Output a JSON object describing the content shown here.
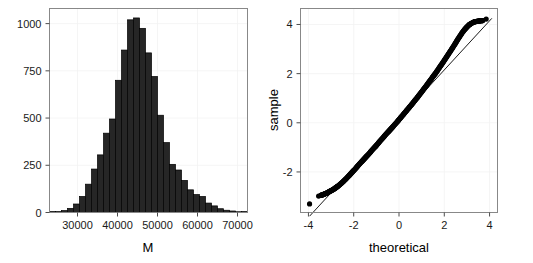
{
  "figure": {
    "width": 533,
    "height": 263,
    "background": "#ffffff",
    "panel_border_color": "#888888",
    "grid_color": "#f2f2f2",
    "bar_fill": "#262626",
    "bar_stroke": "#000000",
    "point_color": "#000000"
  },
  "chart_data": [
    {
      "type": "bar",
      "name": "histogram-of-M",
      "title": "",
      "xlabel": "M",
      "ylabel": "",
      "xlim": [
        23000,
        72500
      ],
      "ylim": [
        0,
        1080
      ],
      "xticks": [
        30000,
        40000,
        50000,
        60000,
        70000
      ],
      "xtick_labels": [
        "30000",
        "40000",
        "50000",
        "60000",
        "70000"
      ],
      "yticks": [
        0,
        250,
        500,
        750,
        1000
      ],
      "ytick_labels": [
        "0",
        "250",
        "500",
        "750",
        "1000"
      ],
      "grid": true,
      "legend": "none",
      "bin_width": 1500,
      "bin_starts": [
        23000,
        24500,
        26000,
        27500,
        29000,
        30500,
        32000,
        33500,
        35000,
        36500,
        38000,
        39500,
        41000,
        42500,
        44000,
        45500,
        47000,
        48500,
        50000,
        51500,
        53000,
        54500,
        56000,
        57500,
        59000,
        60500,
        62000,
        63500,
        65000,
        66500,
        68000,
        69500,
        71000
      ],
      "categories": [
        "23000",
        "24500",
        "26000",
        "27500",
        "29000",
        "30500",
        "32000",
        "33500",
        "35000",
        "36500",
        "38000",
        "39500",
        "41000",
        "42500",
        "44000",
        "45500",
        "47000",
        "48500",
        "50000",
        "51500",
        "53000",
        "54500",
        "56000",
        "57500",
        "59000",
        "60500",
        "62000",
        "63500",
        "65000",
        "66500",
        "68000",
        "69500",
        "71000"
      ],
      "values": [
        2,
        5,
        10,
        22,
        45,
        85,
        150,
        230,
        305,
        420,
        495,
        700,
        860,
        1020,
        1030,
        975,
        845,
        720,
        515,
        370,
        255,
        225,
        170,
        120,
        95,
        85,
        50,
        35,
        20,
        12,
        8,
        4,
        2
      ]
    },
    {
      "type": "scatter",
      "name": "normal-qq-plot",
      "title": "",
      "xlabel": "theoretical",
      "ylabel": "sample",
      "xlim": [
        -4.35,
        4.35
      ],
      "ylim": [
        -3.65,
        4.65
      ],
      "xticks": [
        -4,
        -2,
        0,
        2,
        4
      ],
      "xtick_labels": [
        "-4",
        "-2",
        "0",
        "2",
        "4"
      ],
      "yticks": [
        -2,
        0,
        2,
        4
      ],
      "ytick_labels": [
        "-2",
        "0",
        "2",
        "4"
      ],
      "grid": true,
      "legend": "none",
      "reference_line": {
        "slope": 1.0,
        "intercept": 0.15,
        "x_start": -3.95,
        "x_end": 4.1
      },
      "x": [
        -3.95,
        -3.55,
        -3.45,
        -3.38,
        -3.3,
        -3.22,
        -3.15,
        -3.08,
        -3.0,
        -2.92,
        -2.85,
        -2.78,
        -2.7,
        -2.6,
        -2.5,
        -2.4,
        -2.3,
        -2.2,
        -2.1,
        -2.0,
        -1.9,
        -1.8,
        -1.7,
        -1.6,
        -1.5,
        -1.4,
        -1.3,
        -1.2,
        -1.1,
        -1.0,
        -0.9,
        -0.8,
        -0.7,
        -0.6,
        -0.5,
        -0.4,
        -0.3,
        -0.2,
        -0.1,
        0.0,
        0.1,
        0.2,
        0.3,
        0.4,
        0.5,
        0.6,
        0.7,
        0.8,
        0.9,
        1.0,
        1.1,
        1.2,
        1.3,
        1.4,
        1.5,
        1.6,
        1.7,
        1.8,
        1.9,
        2.0,
        2.1,
        2.2,
        2.3,
        2.4,
        2.5,
        2.6,
        2.7,
        2.8,
        2.9,
        3.0,
        3.1,
        3.2,
        3.3,
        3.4,
        3.5,
        3.6,
        3.7,
        3.85
      ],
      "y": [
        -3.3,
        -2.98,
        -2.95,
        -2.93,
        -2.9,
        -2.87,
        -2.84,
        -2.8,
        -2.76,
        -2.72,
        -2.68,
        -2.63,
        -2.58,
        -2.5,
        -2.42,
        -2.33,
        -2.24,
        -2.14,
        -2.04,
        -1.94,
        -1.84,
        -1.73,
        -1.63,
        -1.53,
        -1.43,
        -1.33,
        -1.23,
        -1.12,
        -1.02,
        -0.92,
        -0.81,
        -0.7,
        -0.6,
        -0.49,
        -0.39,
        -0.29,
        -0.19,
        -0.08,
        0.02,
        0.13,
        0.24,
        0.35,
        0.46,
        0.57,
        0.68,
        0.79,
        0.91,
        1.02,
        1.14,
        1.26,
        1.38,
        1.5,
        1.63,
        1.75,
        1.88,
        2.0,
        2.13,
        2.27,
        2.4,
        2.54,
        2.68,
        2.82,
        2.96,
        3.1,
        3.25,
        3.4,
        3.54,
        3.68,
        3.8,
        3.9,
        3.99,
        4.05,
        4.1,
        4.12,
        4.14,
        4.15,
        4.16,
        4.22
      ]
    }
  ]
}
